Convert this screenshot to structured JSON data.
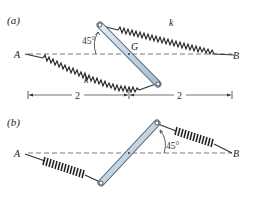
{
  "figure": {
    "part_a": {
      "label": "(a)",
      "point_a": "A",
      "point_b": "B",
      "center_label": "G",
      "angle_label": "45°",
      "spring_upper_label": "k",
      "spring_lower_label": "k",
      "dimension_left": "2",
      "dimension_right": "2"
    },
    "part_b": {
      "label": "(b)",
      "point_a": "A",
      "point_b": "B",
      "angle_label": "45°"
    },
    "colors": {
      "bar_fill": "#c9d6e3",
      "bar_stroke": "#5a6b7c",
      "spring": "#2a2a2a",
      "dashed": "#555555",
      "text": "#222222"
    }
  }
}
